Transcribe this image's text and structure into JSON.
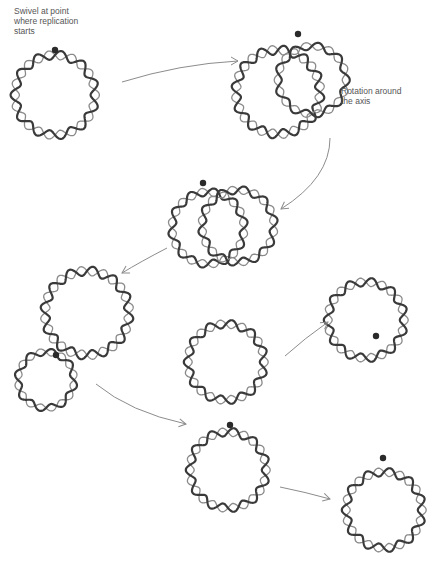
{
  "diagram": {
    "labels": {
      "swivel": "Swivel at point where replication starts",
      "swivel_lines": [
        "Swivel at point",
        "where replication",
        "starts"
      ],
      "rotation_lines": [
        "Rotation around",
        "the axis"
      ]
    },
    "colors": {
      "strand_dark": "#3a3a3a",
      "strand_light": "#8a8a8a",
      "arrow": "#8c8c8c",
      "swivel_dot": "#2a2a2a",
      "background": "#ffffff"
    },
    "nodes": [
      {
        "id": "stage-1-parent-circle",
        "cx": 55,
        "cy": 95,
        "r": 40,
        "turns": 11,
        "swivel": [
          55,
          50
        ]
      },
      {
        "id": "stage-2-rotation-loop-main",
        "cx": 278,
        "cy": 92,
        "r": 42,
        "turns": 12,
        "swivel": [
          298,
          34
        ]
      },
      {
        "id": "stage-2-rotation-loop-new",
        "cx": 312,
        "cy": 80,
        "r": 34,
        "turns": 9,
        "swivel": null
      },
      {
        "id": "stage-3-loop-a",
        "cx": 208,
        "cy": 228,
        "r": 36,
        "turns": 10,
        "swivel": [
          203,
          183
        ]
      },
      {
        "id": "stage-3-loop-b",
        "cx": 238,
        "cy": 226,
        "r": 36,
        "turns": 10,
        "swivel": null
      },
      {
        "id": "stage-4-large-loop",
        "cx": 87,
        "cy": 313,
        "r": 42,
        "turns": 12,
        "swivel": [
          56,
          355
        ]
      },
      {
        "id": "stage-4-small-loop",
        "cx": 46,
        "cy": 380,
        "r": 28,
        "turns": 8,
        "swivel": null
      },
      {
        "id": "stage-5-upper-loop",
        "cx": 226,
        "cy": 362,
        "r": 38,
        "turns": 11,
        "swivel": [
          230,
          425
        ]
      },
      {
        "id": "stage-5-lower-loop",
        "cx": 228,
        "cy": 470,
        "r": 38,
        "turns": 11,
        "swivel": null
      },
      {
        "id": "daughter-upper",
        "cx": 366,
        "cy": 320,
        "r": 38,
        "turns": 11,
        "swivel": [
          376,
          336
        ]
      },
      {
        "id": "daughter-lower",
        "cx": 384,
        "cy": 510,
        "r": 38,
        "turns": 11,
        "swivel": [
          383,
          458
        ]
      }
    ],
    "arrows": [
      {
        "id": "arrow-1-to-2",
        "d": "M122,82 Q180,64 238,61",
        "head": [
          238,
          61
        ],
        "angle": 0
      },
      {
        "id": "arrow-2-to-3",
        "d": "M330,138 Q330,178 281,209",
        "head": [
          281,
          209
        ],
        "angle": 145
      },
      {
        "id": "arrow-3-to-4",
        "d": "M167,248 Q140,262 122,273",
        "head": [
          122,
          273
        ],
        "angle": 150
      },
      {
        "id": "arrow-4-to-5",
        "d": "M96,384 Q130,412 186,424",
        "head": [
          186,
          424
        ],
        "angle": 10
      },
      {
        "id": "arrow-5-to-upper",
        "d": "M285,356 Q305,338 328,322",
        "head": [
          328,
          322
        ],
        "angle": -35
      },
      {
        "id": "arrow-5-to-lower",
        "d": "M280,487 Q305,492 330,499",
        "head": [
          330,
          499
        ],
        "angle": 15
      }
    ]
  }
}
